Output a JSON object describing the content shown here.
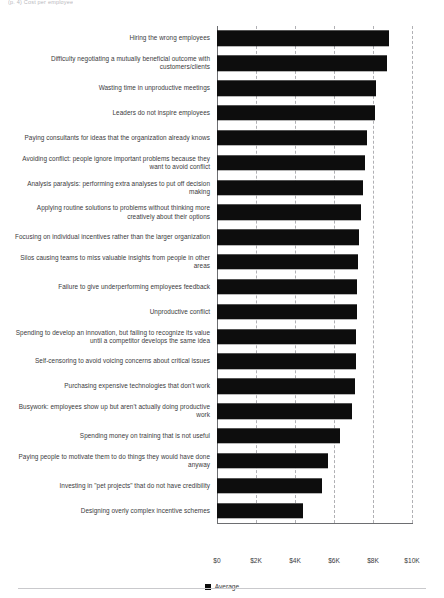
{
  "header": {
    "caption": "(p. 4) Cost per employee"
  },
  "legend": {
    "label": "Average",
    "swatch_color": "#0d0d0d",
    "position": "bottom-center"
  },
  "footer": {
    "rule_color": "#c9c9cc"
  },
  "chart_data": {
    "type": "bar",
    "orientation": "horizontal",
    "title": "",
    "subtitle": "",
    "xlabel": "",
    "ylabel": "",
    "xlim": [
      0,
      10000
    ],
    "grid": true,
    "grid_axis": "x",
    "tick_labels": [
      "$0",
      "$2K",
      "$4K",
      "$6K",
      "$8K",
      "$10K"
    ],
    "tick_values": [
      0,
      2000,
      4000,
      6000,
      8000,
      10000
    ],
    "series": [
      {
        "name": "Average",
        "color": "#0d0d0d",
        "values": [
          8800,
          8700,
          8150,
          8100,
          7700,
          7600,
          7500,
          7400,
          7300,
          7250,
          7200,
          7200,
          7150,
          7150,
          7100,
          6900,
          6300,
          5700,
          5400,
          4400
        ]
      }
    ],
    "categories": [
      "Hiring the wrong employees",
      "Difficulty negotiating a mutually beneficial outcome with customers/clients",
      "Wasting time in unproductive meetings",
      "Leaders do not inspire employees",
      "Paying consultants for ideas that the organization already knows",
      "Avoiding conflict: people ignore important problems because they want to avoid conflict",
      "Analysis paralysis: performing extra analyses to put off decision making",
      "Applying routine solutions to problems without thinking more creatively about their options",
      "Focusing on individual incentives rather than the larger organization",
      "Silos causing teams to miss valuable insights from people in other areas",
      "Failure to give underperforming employees feedback",
      "Unproductive conflict",
      "Spending to develop an innovation, but failing to recognize its value until a competitor develops the same idea",
      "Self-censoring to avoid voicing concerns about critical issues",
      "Purchasing expensive technologies that don't work",
      "Busywork: employees show up but aren't actually doing productive work",
      "Spending money on training that is not useful",
      "Paying people to motivate them to do things they would have done anyway",
      "Investing in \"pet projects\" that do not have credibility",
      "Designing overly complex incentive schemes"
    ]
  }
}
